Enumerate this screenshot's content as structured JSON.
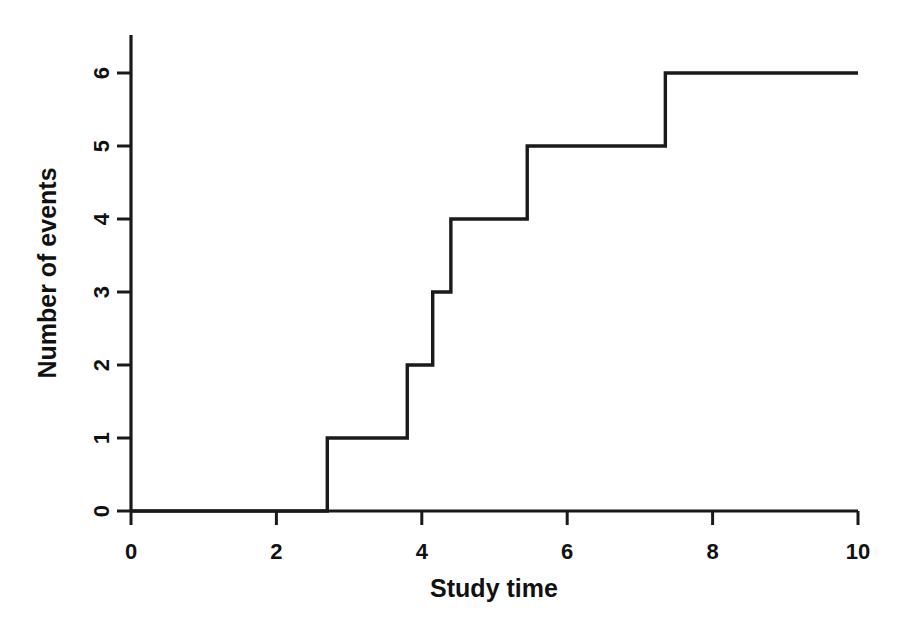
{
  "chart_data": {
    "type": "line",
    "subtype": "step-post",
    "title": "",
    "subtitle": "",
    "xlabel": "Study time",
    "ylabel": "Number of events",
    "xlim": [
      0,
      10
    ],
    "ylim": [
      0,
      6
    ],
    "xticks": [
      0,
      2,
      4,
      6,
      8,
      10
    ],
    "xtick_labels": [
      "0",
      "2",
      "4",
      "6",
      "8",
      "10"
    ],
    "yticks": [
      0,
      1,
      2,
      3,
      4,
      5,
      6
    ],
    "ytick_labels": [
      "0",
      "1",
      "2",
      "3",
      "4",
      "5",
      "6"
    ],
    "grid": false,
    "legend": false,
    "legend_position": "none",
    "line_color": "#1a1a1a",
    "background_color": "#ffffff",
    "series": [
      {
        "name": "Cumulative number of events",
        "x": [
          0,
          2.7,
          2.7,
          3.8,
          3.8,
          4.15,
          4.15,
          4.4,
          4.4,
          5.45,
          5.45,
          7.35,
          7.35,
          10
        ],
        "y": [
          0,
          0,
          1,
          1,
          2,
          2,
          3,
          3,
          4,
          4,
          5,
          5,
          6,
          6
        ]
      }
    ],
    "event_times": [
      2.7,
      3.8,
      4.15,
      4.4,
      5.45,
      7.35
    ],
    "cumulative_counts": [
      1,
      2,
      3,
      4,
      5,
      6
    ],
    "annotations": []
  },
  "axes": {
    "x_axis_name": "Study time",
    "y_axis_name": "Number of events"
  }
}
